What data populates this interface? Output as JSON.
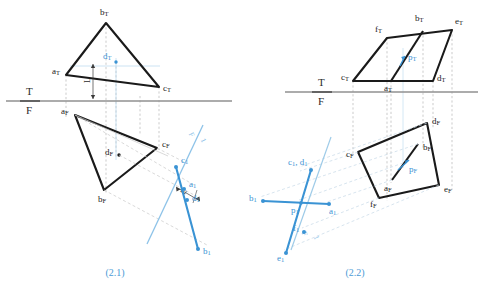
{
  "figure": {
    "background_color": "#ffffff",
    "black_color": "#1a1a1a",
    "blue_color": "#3a93d4",
    "light_blue_color": "#9ecbe8",
    "gray_color": "#8c8c8c",
    "width": 482,
    "height": 296
  },
  "panels": [
    {
      "id": "panel-2-1",
      "caption": "(2.1)",
      "caption_x": 115,
      "caption_y": 273,
      "axis": {
        "label_top": "T",
        "label_bottom": "F",
        "label_x": 28,
        "label_top_y": 92,
        "label_bottom_y": 110,
        "line_x1": 6,
        "line_x2": 232,
        "line_y": 101
      },
      "dimension": {
        "label": "L",
        "label_x": 88,
        "label_y": 86,
        "rotation": -90
      },
      "fold_label": {
        "top": "F",
        "bottom": "1",
        "x": 196,
        "y": 139,
        "rotation": 66
      },
      "top_view": {
        "name": "triangle-top-view",
        "points": [
          {
            "id": "a_T",
            "label": "a",
            "sub": "T",
            "x": 66,
            "y": 75,
            "label_x": 54,
            "label_y": 72
          },
          {
            "id": "b_T",
            "label": "b",
            "sub": "T",
            "x": 106,
            "y": 23,
            "label_x": 103,
            "label_y": 13
          },
          {
            "id": "c_T",
            "label": "c",
            "sub": "T",
            "x": 159,
            "y": 87,
            "label_x": 163,
            "label_y": 88
          }
        ],
        "interior_point": {
          "id": "d_T",
          "label": "d",
          "sub": "T",
          "x": 116,
          "y": 62,
          "label_x": 104,
          "label_y": 57
        }
      },
      "front_view": {
        "name": "triangle-front-view",
        "points": [
          {
            "id": "a_F",
            "label": "a",
            "sub": "F",
            "x": 75,
            "y": 115,
            "label_x": 63,
            "label_y": 112
          },
          {
            "id": "b_F",
            "label": "b",
            "sub": "F",
            "x": 104,
            "y": 190,
            "label_x": 100,
            "label_y": 199
          },
          {
            "id": "c_F",
            "label": "c",
            "sub": "F",
            "x": 157,
            "y": 148,
            "label_x": 163,
            "label_y": 145
          }
        ],
        "interior_point": {
          "id": "d_F",
          "label": "d",
          "sub": "F",
          "x": 119,
          "y": 155,
          "label_x": 107,
          "label_y": 153
        }
      },
      "aux_view": {
        "name": "triangle-auxiliary-view",
        "points": [
          {
            "id": "c_1",
            "label": "c",
            "sub": "1",
            "x": 176,
            "y": 167,
            "label_x": 182,
            "label_y": 161
          },
          {
            "id": "a_1",
            "label": "a",
            "sub": "1",
            "x": 184,
            "y": 189,
            "label_x": 190,
            "label_y": 186
          },
          {
            "id": "d_1",
            "label": "d",
            "sub": "1",
            "x": 187,
            "y": 200,
            "label_x": 193,
            "label_y": 199
          },
          {
            "id": "b_1",
            "label": "b",
            "sub": "1",
            "x": 198,
            "y": 249,
            "label_x": 204,
            "label_y": 251
          }
        ]
      }
    },
    {
      "id": "panel-2-2",
      "caption": "(2.2)",
      "caption_x": 355,
      "caption_y": 273,
      "axis": {
        "label_top": "T",
        "label_bottom": "F",
        "label_x": 320,
        "label_top_y": 83,
        "label_bottom_y": 101,
        "line_x1": 285,
        "line_x2": 478,
        "line_y": 92
      },
      "fold_label": {
        "top": "F",
        "bottom": "1",
        "x": 315,
        "y": 237,
        "rotation": 66
      },
      "top_view": {
        "name": "parallelogram-top-view",
        "points": [
          {
            "id": "c_T",
            "label": "c",
            "sub": "T",
            "x": 353,
            "y": 81,
            "label_x": 343,
            "label_y": 78
          },
          {
            "id": "a_T",
            "label": "a",
            "sub": "T",
            "x": 391,
            "y": 81,
            "label_x": 387,
            "label_y": 88
          },
          {
            "id": "d_T",
            "label": "d",
            "sub": "T",
            "x": 433,
            "y": 81,
            "label_x": 438,
            "label_y": 79
          },
          {
            "id": "f_T",
            "label": "f",
            "sub": "T",
            "x": 387,
            "y": 38,
            "label_x": 375,
            "label_y": 30
          },
          {
            "id": "b_T",
            "label": "b",
            "sub": "T",
            "x": 423,
            "y": 31,
            "label_x": 417,
            "label_y": 19
          },
          {
            "id": "e_T",
            "label": "e",
            "sub": "T",
            "x": 452,
            "y": 30,
            "label_x": 457,
            "label_y": 22
          }
        ],
        "interior_point": {
          "id": "p_T",
          "label": "p",
          "sub": "T",
          "x": 403,
          "y": 59,
          "label_x": 409,
          "label_y": 58
        }
      },
      "front_view": {
        "name": "quad-front-view",
        "points": [
          {
            "id": "c_F",
            "label": "c",
            "sub": "F",
            "x": 358,
            "y": 152,
            "label_x": 350,
            "label_y": 154
          },
          {
            "id": "d_F",
            "label": "d",
            "sub": "F",
            "x": 427,
            "y": 123,
            "label_x": 434,
            "label_y": 123
          },
          {
            "id": "e_F",
            "label": "e",
            "sub": "F",
            "x": 439,
            "y": 185,
            "label_x": 447,
            "label_y": 188
          },
          {
            "id": "f_F",
            "label": "f",
            "sub": "F",
            "x": 379,
            "y": 198,
            "label_x": 372,
            "label_y": 203
          },
          {
            "id": "a_F",
            "label": "a",
            "sub": "F",
            "x": 392,
            "y": 180,
            "label_x": 387,
            "label_y": 187
          },
          {
            "id": "b_F",
            "label": "b",
            "sub": "F",
            "x": 418,
            "y": 144,
            "label_x": 424,
            "label_y": 148
          }
        ],
        "interior_point": {
          "id": "p_F",
          "label": "p",
          "sub": "F",
          "x": 403,
          "y": 163,
          "label_x": 410,
          "label_y": 168
        }
      },
      "aux_view": {
        "name": "aux-view-lines",
        "points": [
          {
            "id": "c_1_d_1",
            "label": "c",
            "sub": "1",
            "label2": "d",
            "sub2": "1",
            "x": 311,
            "y": 170,
            "label_x": 290,
            "label_y": 163
          },
          {
            "id": "b_1",
            "label": "b",
            "sub": "1",
            "x": 263,
            "y": 201,
            "label_x": 252,
            "label_y": 200
          },
          {
            "id": "a_1",
            "label": "a",
            "sub": "1",
            "x": 329,
            "y": 204,
            "label_x": 331,
            "label_y": 211
          },
          {
            "id": "p_1",
            "label": "p",
            "sub": "1",
            "x": 301,
            "y": 203,
            "label_x": 293,
            "label_y": 210
          },
          {
            "id": "f_1",
            "label": "f",
            "sub": "1",
            "x": 304,
            "y": 232,
            "label_x": 295,
            "label_y": 230
          },
          {
            "id": "e_1",
            "label": "e",
            "sub": "1",
            "x": 286,
            "y": 253,
            "label_x": 279,
            "label_y": 258
          }
        ]
      }
    }
  ]
}
